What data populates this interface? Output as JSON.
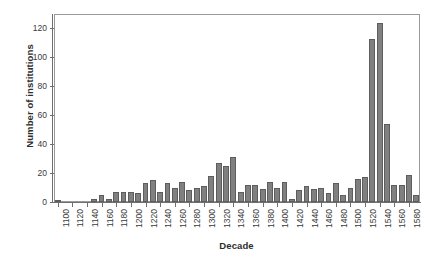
{
  "chart_data": {
    "type": "bar",
    "title": "",
    "xlabel": "Decade",
    "ylabel": "Number of institutions",
    "ylim": [
      0,
      130
    ],
    "yticks": [
      0,
      20,
      40,
      60,
      80,
      100,
      120
    ],
    "ytick_labels": [
      "0",
      "20",
      "40",
      "60",
      "80",
      "100",
      "120"
    ],
    "grid": false,
    "legend": null,
    "xtick_labels": [
      "1100",
      "1120",
      "1140",
      "1160",
      "1180",
      "1200",
      "1220",
      "1240",
      "1260",
      "1280",
      "1300",
      "1320",
      "1340",
      "1360",
      "1380",
      "1400",
      "1420",
      "1440",
      "1460",
      "1480",
      "1500",
      "1520",
      "1540",
      "1560",
      "1580"
    ],
    "xtick_step": 20,
    "bar_color": "#808080",
    "bar_edge_color": "#5d5d5d",
    "axis_color": "#6f6f6f",
    "categories": [
      "1100",
      "1110",
      "1120",
      "1130",
      "1140",
      "1150",
      "1160",
      "1170",
      "1180",
      "1190",
      "1200",
      "1210",
      "1220",
      "1230",
      "1240",
      "1250",
      "1260",
      "1270",
      "1280",
      "1290",
      "1300",
      "1310",
      "1320",
      "1330",
      "1340",
      "1350",
      "1360",
      "1370",
      "1380",
      "1390",
      "1400",
      "1410",
      "1420",
      "1430",
      "1440",
      "1450",
      "1460",
      "1470",
      "1480",
      "1490",
      "1500",
      "1510",
      "1520",
      "1530",
      "1540",
      "1550",
      "1560",
      "1570",
      "1580",
      "1590"
    ],
    "values": [
      1,
      0,
      0,
      0,
      0,
      2,
      5,
      2,
      7,
      7,
      7,
      6,
      13,
      15,
      7,
      13,
      10,
      14,
      8,
      10,
      11,
      18,
      27,
      25,
      31,
      7,
      12,
      12,
      9,
      14,
      10,
      14,
      2,
      8,
      11,
      9,
      10,
      6,
      13,
      5,
      10,
      16,
      17,
      113,
      124,
      54,
      12,
      12,
      19,
      5
    ]
  }
}
